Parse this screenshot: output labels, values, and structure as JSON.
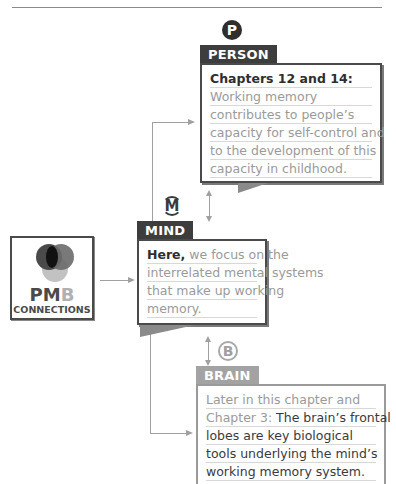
{
  "diagram": {
    "title": "PMB Connections",
    "pmb_logo": {
      "letters_dark": "PM",
      "letters_light": "B",
      "subtitle": "CONNECTIONS",
      "icon": "venn-circles-icon"
    },
    "person": {
      "badge": "P",
      "label": "PERSON",
      "heading": "Chapters 12 and 14:",
      "lines": [
        "Working memory",
        "contributes to people’s",
        "capacity for self-control and",
        "to the development of this",
        "capacity in childhood."
      ]
    },
    "mind": {
      "badge": "M",
      "label": "MIND",
      "heading": "Here,",
      "lines": [
        " we focus on the",
        "interrelated mental systems",
        "that make up working",
        "memory."
      ]
    },
    "brain": {
      "badge": "B",
      "label": "BRAIN",
      "heading_lines": [
        "Later in this chapter and",
        "Chapter 3:"
      ],
      "lines": [
        " The brain’s frontal",
        "lobes are key biological",
        "tools underlying the mind’s",
        "working memory system."
      ]
    },
    "colors": {
      "dark": "#3d3d3d",
      "light": "#a3a3a3",
      "connector": "#a0a0a0"
    }
  }
}
